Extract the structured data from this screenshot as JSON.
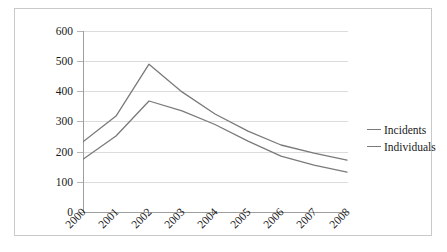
{
  "chart_data": {
    "type": "line",
    "title": "",
    "xlabel": "",
    "ylabel": "",
    "categories": [
      "2000",
      "2001",
      "2002",
      "2003",
      "2004",
      "2005",
      "2006",
      "2007",
      "2008"
    ],
    "ylim": [
      0,
      600
    ],
    "ytick_step": 100,
    "yticks": [
      "0",
      "100",
      "200",
      "300",
      "400",
      "500",
      "600"
    ],
    "grid": true,
    "legend_position": "right",
    "line_color": "#7a7a7a",
    "gridline_color": "#dcdcdc",
    "axis_color": "#9e9e9e",
    "series": [
      {
        "name": "Incidents",
        "values": [
          233,
          318,
          490,
          398,
          325,
          268,
          222,
          195,
          172
        ]
      },
      {
        "name": "Individuals",
        "values": [
          175,
          252,
          368,
          335,
          290,
          235,
          185,
          155,
          132
        ]
      }
    ]
  },
  "legend": {
    "items": [
      {
        "label": "Incidents"
      },
      {
        "label": "Individuals"
      }
    ]
  }
}
